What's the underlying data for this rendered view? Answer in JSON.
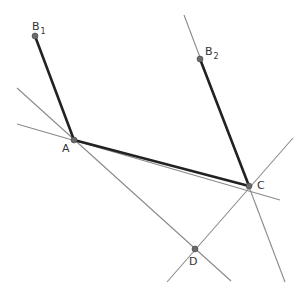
{
  "diagram": {
    "type": "geometry-construction",
    "colors": {
      "thin_line": "#8a8a8a",
      "thick_segment": "#222222",
      "point_fill": "#6a6a6a",
      "label": "#333333",
      "background": "#ffffff"
    },
    "points": [
      {
        "id": "B1",
        "label": "B",
        "subscript": "1",
        "x": 35,
        "y": 36
      },
      {
        "id": "B2",
        "label": "B",
        "subscript": "2",
        "x": 200,
        "y": 59
      },
      {
        "id": "A",
        "label": "A",
        "subscript": "",
        "x": 74,
        "y": 140
      },
      {
        "id": "C",
        "label": "C",
        "subscript": "",
        "x": 249,
        "y": 186
      },
      {
        "id": "D",
        "label": "D",
        "subscript": "",
        "x": 195,
        "y": 249
      }
    ],
    "thick_segments": [
      {
        "from": "B1",
        "to": "A"
      },
      {
        "from": "A",
        "to": "C"
      },
      {
        "from": "B2",
        "to": "C"
      }
    ],
    "thin_lines": [
      {
        "name": "line-through-A-and-D",
        "x1": 17,
        "y1": 88,
        "x2": 231,
        "y2": 281
      },
      {
        "name": "line-through-A-and-C",
        "x1": 17,
        "y1": 124,
        "x2": 280,
        "y2": 200
      },
      {
        "name": "line-through-B2-and-C",
        "x1": 184,
        "y1": 15,
        "x2": 285,
        "y2": 282
      },
      {
        "name": "line-through-D-and-C",
        "x1": 167,
        "y1": 282,
        "x2": 293,
        "y2": 138
      }
    ]
  }
}
